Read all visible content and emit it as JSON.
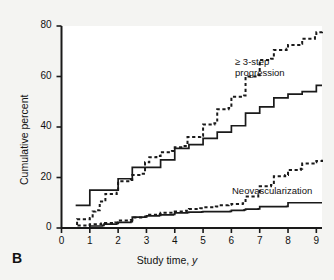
{
  "figure": {
    "panel_label": "B",
    "background_color": "#f4f4f2",
    "plot_background_color": "#ffffff",
    "line_color": "#1a1a1a"
  },
  "annotations": {
    "progression_line1": "≥ 3-step",
    "progression_line2": "progression",
    "neovascularization": "Neovascularization"
  },
  "axes": {
    "x_title_main": "Study time,",
    "x_title_italic": "y",
    "y_title": "Cumulative percent",
    "x_ticks": [
      "0",
      "1",
      "2",
      "3",
      "4",
      "5",
      "6",
      "7",
      "8",
      "9"
    ],
    "y_ticks": [
      "0",
      "20",
      "40",
      "60",
      "80"
    ]
  },
  "chart_data": {
    "type": "line",
    "title": "",
    "subtitle": "",
    "xlabel": "Study time, y",
    "ylabel": "Cumulative percent",
    "xlim": [
      0,
      9.2
    ],
    "ylim": [
      0,
      80
    ],
    "grid": false,
    "legend_position": "inline-annotations",
    "x_ticks": [
      0,
      1,
      2,
      3,
      4,
      5,
      6,
      7,
      8,
      9
    ],
    "y_ticks": [
      0,
      20,
      40,
      60,
      80
    ],
    "step_type": "post",
    "series": [
      {
        "name": "≥ 3-step progression (dashed)",
        "style": "dashed",
        "annotation": "≥ 3-step progression",
        "points": [
          [
            0.45,
            0.0
          ],
          [
            0.55,
            3.5
          ],
          [
            0.95,
            3.5
          ],
          [
            1.0,
            4.0
          ],
          [
            1.1,
            6.5
          ],
          [
            1.2,
            7.0
          ],
          [
            1.35,
            10.5
          ],
          [
            1.5,
            11.0
          ],
          [
            1.55,
            13.5
          ],
          [
            1.95,
            14.0
          ],
          [
            2.0,
            18.5
          ],
          [
            2.45,
            19.0
          ],
          [
            2.5,
            21.0
          ],
          [
            2.8,
            21.5
          ],
          [
            2.95,
            26.0
          ],
          [
            3.1,
            28.0
          ],
          [
            3.35,
            28.5
          ],
          [
            3.5,
            30.0
          ],
          [
            3.9,
            30.5
          ],
          [
            4.0,
            32.0
          ],
          [
            4.3,
            32.5
          ],
          [
            4.45,
            36.0
          ],
          [
            4.9,
            36.5
          ],
          [
            5.0,
            41.0
          ],
          [
            5.4,
            41.5
          ],
          [
            5.5,
            47.0
          ],
          [
            5.9,
            47.5
          ],
          [
            6.0,
            52.0
          ],
          [
            6.45,
            52.5
          ],
          [
            6.5,
            60.0
          ],
          [
            6.95,
            60.5
          ],
          [
            7.0,
            66.5
          ],
          [
            7.4,
            67.0
          ],
          [
            7.5,
            70.5
          ],
          [
            7.95,
            71.0
          ],
          [
            8.0,
            72.5
          ],
          [
            8.45,
            73.0
          ],
          [
            8.5,
            75.0
          ],
          [
            8.95,
            75.5
          ],
          [
            9.0,
            77.5
          ],
          [
            9.2,
            78.0
          ]
        ],
        "final_value": 78.0
      },
      {
        "name": "≥ 3-step progression (solid)",
        "style": "solid",
        "annotation": "",
        "points": [
          [
            0.5,
            9.0
          ],
          [
            0.95,
            9.0
          ],
          [
            1.0,
            15.0
          ],
          [
            1.9,
            15.0
          ],
          [
            2.0,
            19.5
          ],
          [
            2.45,
            19.5
          ],
          [
            2.5,
            24.0
          ],
          [
            3.4,
            24.0
          ],
          [
            3.5,
            27.0
          ],
          [
            3.95,
            27.0
          ],
          [
            4.0,
            31.5
          ],
          [
            4.45,
            31.5
          ],
          [
            4.5,
            33.0
          ],
          [
            4.95,
            33.0
          ],
          [
            5.0,
            35.5
          ],
          [
            5.45,
            35.5
          ],
          [
            5.5,
            38.0
          ],
          [
            5.95,
            38.0
          ],
          [
            6.0,
            40.5
          ],
          [
            6.45,
            40.5
          ],
          [
            6.5,
            45.5
          ],
          [
            6.95,
            45.5
          ],
          [
            7.0,
            48.0
          ],
          [
            7.45,
            48.0
          ],
          [
            7.5,
            51.5
          ],
          [
            7.95,
            51.5
          ],
          [
            8.0,
            53.0
          ],
          [
            8.45,
            53.0
          ],
          [
            8.5,
            54.0
          ],
          [
            8.95,
            54.0
          ],
          [
            9.0,
            56.5
          ],
          [
            9.2,
            56.5
          ]
        ],
        "final_value": 56.5
      },
      {
        "name": "Neovascularization (dashed)",
        "style": "dashed",
        "annotation": "Neovascularization",
        "points": [
          [
            0.45,
            0.0
          ],
          [
            0.6,
            1.0
          ],
          [
            0.95,
            1.2
          ],
          [
            1.0,
            1.5
          ],
          [
            1.4,
            1.8
          ],
          [
            1.5,
            2.0
          ],
          [
            1.9,
            2.2
          ],
          [
            2.0,
            3.0
          ],
          [
            2.45,
            3.2
          ],
          [
            2.5,
            4.2
          ],
          [
            2.9,
            4.5
          ],
          [
            3.0,
            5.2
          ],
          [
            3.4,
            5.5
          ],
          [
            3.5,
            6.0
          ],
          [
            3.95,
            6.2
          ],
          [
            4.0,
            6.5
          ],
          [
            4.4,
            6.8
          ],
          [
            4.5,
            7.5
          ],
          [
            4.9,
            7.8
          ],
          [
            5.0,
            8.2
          ],
          [
            5.45,
            8.5
          ],
          [
            5.5,
            9.0
          ],
          [
            5.9,
            9.2
          ],
          [
            6.0,
            9.5
          ],
          [
            6.4,
            9.8
          ],
          [
            6.5,
            12.5
          ],
          [
            6.95,
            13.0
          ],
          [
            7.0,
            16.5
          ],
          [
            7.4,
            17.0
          ],
          [
            7.5,
            20.5
          ],
          [
            7.9,
            21.0
          ],
          [
            8.0,
            23.0
          ],
          [
            8.45,
            23.5
          ],
          [
            8.5,
            25.5
          ],
          [
            8.95,
            26.0
          ],
          [
            9.0,
            26.5
          ],
          [
            9.2,
            27.0
          ]
        ],
        "final_value": 27.0
      },
      {
        "name": "Neovascularization (solid)",
        "style": "solid",
        "annotation": "",
        "points": [
          [
            0.5,
            0.0
          ],
          [
            1.0,
            0.8
          ],
          [
            1.45,
            1.0
          ],
          [
            1.5,
            1.5
          ],
          [
            1.95,
            1.8
          ],
          [
            2.0,
            2.2
          ],
          [
            2.45,
            2.5
          ],
          [
            2.5,
            4.3
          ],
          [
            2.95,
            4.5
          ],
          [
            3.0,
            4.8
          ],
          [
            3.45,
            5.0
          ],
          [
            3.5,
            5.2
          ],
          [
            3.95,
            5.4
          ],
          [
            4.0,
            6.0
          ],
          [
            4.45,
            6.2
          ],
          [
            4.5,
            6.3
          ],
          [
            4.95,
            6.4
          ],
          [
            5.0,
            6.5
          ],
          [
            5.95,
            6.6
          ],
          [
            6.0,
            7.0
          ],
          [
            6.45,
            7.2
          ],
          [
            6.5,
            7.5
          ],
          [
            6.95,
            7.6
          ],
          [
            7.0,
            8.5
          ],
          [
            7.95,
            8.6
          ],
          [
            8.0,
            10.0
          ],
          [
            9.2,
            10.0
          ]
        ],
        "final_value": 10.0
      }
    ]
  }
}
